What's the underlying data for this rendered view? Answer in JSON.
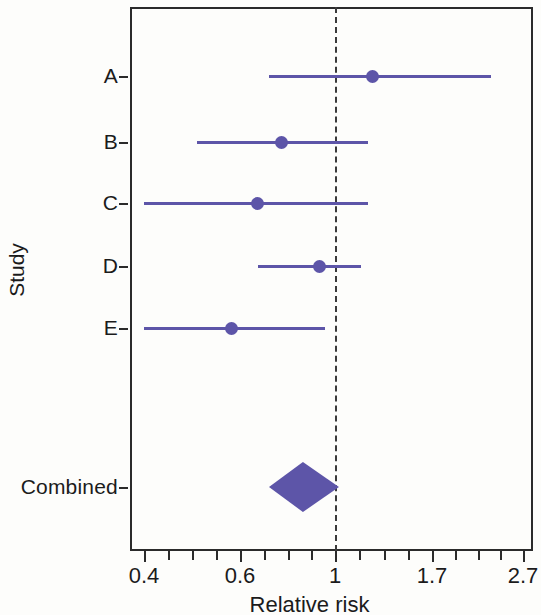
{
  "chart_data": {
    "type": "scatter",
    "subtype": "forest-plot",
    "title": "",
    "xlabel": "Relative risk",
    "ylabel": "Study",
    "xscale": "log",
    "xlim": [
      0.4,
      2.7
    ],
    "xticklabels": [
      "0.4",
      "0.6",
      "1",
      "1.7",
      "2.7"
    ],
    "xtickvalues": [
      0.4,
      0.6,
      1,
      1.7,
      2.7
    ],
    "minor_ticks_per_interval": 3,
    "grid": false,
    "legend": null,
    "null_line": 1,
    "null_line_style": "dashed",
    "categories": [
      "A",
      "B",
      "C",
      "D",
      "E",
      "Combined"
    ],
    "marker_color": "#5d55a8",
    "line_color": "#5d55a8",
    "axis_color": "#2b2b2b",
    "series": [
      {
        "name": "Relative risk (95% CI)",
        "points": [
          {
            "study": "A",
            "estimate": 1.23,
            "ci_low": 0.7,
            "ci_high": 2.3,
            "marker": "circle"
          },
          {
            "study": "B",
            "estimate": 0.75,
            "ci_low": 0.5,
            "ci_high": 1.2,
            "marker": "circle"
          },
          {
            "study": "C",
            "estimate": 0.66,
            "ci_low": 0.4,
            "ci_high": 1.2,
            "marker": "circle"
          },
          {
            "study": "D",
            "estimate": 0.92,
            "ci_low": 0.66,
            "ci_high": 1.15,
            "marker": "circle"
          },
          {
            "study": "E",
            "estimate": 0.58,
            "ci_low": 0.4,
            "ci_high": 0.95,
            "marker": "circle"
          },
          {
            "study": "Combined",
            "estimate": 0.84,
            "ci_low": 0.7,
            "ci_high": 1.02,
            "marker": "diamond"
          }
        ]
      }
    ]
  },
  "axes": {
    "y_title": "Study",
    "x_title": "Relative risk",
    "y_categories": [
      {
        "label": "A"
      },
      {
        "label": "B"
      },
      {
        "label": "C"
      },
      {
        "label": "D"
      },
      {
        "label": "E"
      },
      {
        "label": "Combined"
      }
    ],
    "x_ticks": [
      {
        "label": "0.4"
      },
      {
        "label": "0.6"
      },
      {
        "label": "1"
      },
      {
        "label": "1.7"
      },
      {
        "label": "2.7"
      }
    ]
  }
}
